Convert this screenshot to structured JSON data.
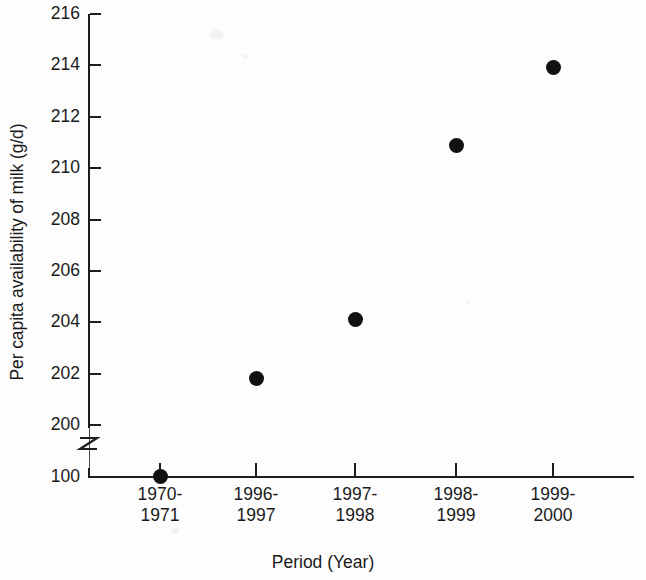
{
  "chart_data": {
    "type": "scatter",
    "title": "",
    "xlabel": "Period (Year)",
    "ylabel": "Per capita availability of milk (g/d)",
    "categories": [
      "1970-\n1971",
      "1996-\n1997",
      "1997-\n1998",
      "1998-\n1999",
      "1999-\n2000"
    ],
    "category_labels": [
      {
        "line1": "1970-",
        "line2": "1971"
      },
      {
        "line1": "1996-",
        "line2": "1997"
      },
      {
        "line1": "1997-",
        "line2": "1998"
      },
      {
        "line1": "1998-",
        "line2": "1999"
      },
      {
        "line1": "1999-",
        "line2": "2000"
      }
    ],
    "values": [
      100.4,
      201.8,
      204.1,
      210.9,
      213.9
    ],
    "ylim": [
      100,
      216
    ],
    "y_axis_broken": true,
    "y_break_between": [
      100,
      200
    ],
    "yticks": [
      216,
      214,
      212,
      210,
      208,
      206,
      204,
      202,
      200,
      100
    ],
    "ytick_labels": [
      "216",
      "214",
      "212",
      "210",
      "208",
      "206",
      "204",
      "202",
      "200",
      "100"
    ],
    "grid": false,
    "legend": null,
    "marker": "filled-circle",
    "marker_color": "#111111"
  },
  "axis": {
    "line_color": "#1d1d1d",
    "break_symbol": "zigzag"
  },
  "figure": {
    "background": "#fdfdfd"
  }
}
